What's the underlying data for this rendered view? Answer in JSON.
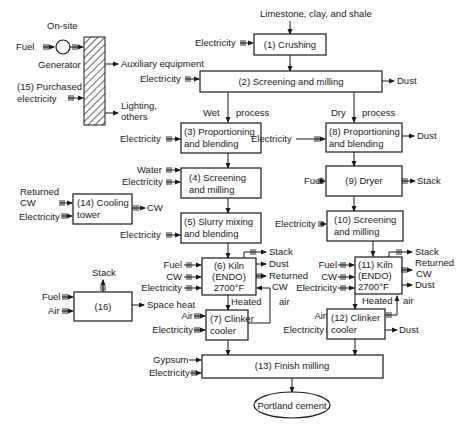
{
  "diagram": {
    "inputs": {
      "raw": "Limestone, clay, and shale",
      "electricity": "Electricity",
      "fuel": "Fuel",
      "water": "Water",
      "cw": "CW",
      "air": "Air",
      "gypsum": "Gypsum",
      "returned": "Returned",
      "returned_cw": "Returned CW"
    },
    "outputs": {
      "dust": "Dust",
      "stack": "Stack",
      "returned": "Returned",
      "cw": "CW",
      "space_heat": "Space heat",
      "aux": "Auxiliary equipment",
      "lighting1": "Lighting,",
      "lighting2": "others"
    },
    "power": {
      "onsite": "On-site",
      "generator": "Generator",
      "purchased1": "(15) Purchased",
      "purchased2": "electricity"
    },
    "branches": {
      "wet": "Wet",
      "dry": "Dry",
      "process": "process",
      "heated": "Heated",
      "air": "air"
    },
    "boxes": {
      "b1": "(1) Crushing",
      "b2": "(2) Screening and milling",
      "b3a": "(3) Proportioning",
      "b3b": "and blending",
      "b4a": "(4) Screening",
      "b4b": "and milling",
      "b5a": "(5) Slurry mixing",
      "b5b": "and blending",
      "b6a": "(6) Kiln",
      "b6b": "(ENDO)",
      "b6c": "2700°F",
      "b7a": "(7) Clinker",
      "b7b": "cooler",
      "b8a": "(8) Proportioning",
      "b8b": "and blending",
      "b9": "(9) Dryer",
      "b10a": "(10) Screening",
      "b10b": "and milling",
      "b11a": "(11) Kiln",
      "b11b": "(ENDO)",
      "b11c": "2700°F",
      "b12a": "(12) Clinker",
      "b12b": "cooler",
      "b13": "(13) Finish milling",
      "b14a": "(14) Cooling",
      "b14b": "tower",
      "b16": "(16)"
    },
    "product": "Portland cement"
  }
}
